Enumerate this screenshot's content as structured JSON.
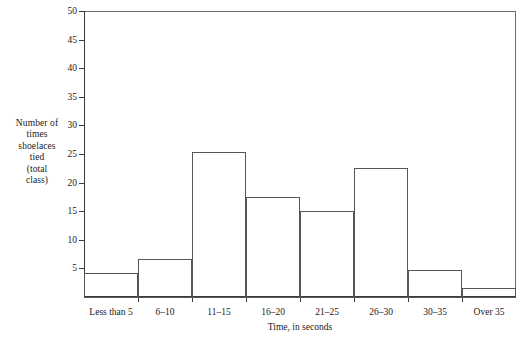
{
  "chart_data": {
    "type": "bar",
    "title": "",
    "xlabel": "Time, in seconds",
    "ylabel": "Number of times shoelaces tied (total class)",
    "ylabel_lines": [
      "Number of",
      "times",
      "shoelaces",
      "tied",
      "(total",
      "class)"
    ],
    "categories": [
      "Less than 5",
      "6–10",
      "11–15",
      "16–20",
      "21–25",
      "26–30",
      "30–35",
      "Over 35"
    ],
    "values": [
      4.2,
      6.7,
      25.3,
      17.5,
      15,
      22.5,
      4.8,
      1.5
    ],
    "ylim": [
      0,
      50
    ],
    "ytick_values": [
      5,
      10,
      15,
      20,
      25,
      30,
      35,
      40,
      45,
      50
    ],
    "ytick_labels": [
      "5",
      "10",
      "15",
      "20",
      "25",
      "30",
      "35",
      "40",
      "45",
      "50"
    ],
    "grid": false,
    "legend": null,
    "bar_style": {
      "fill": "#ffffff",
      "edge": "#55565a"
    },
    "axis_color": "#3a3a3a"
  }
}
